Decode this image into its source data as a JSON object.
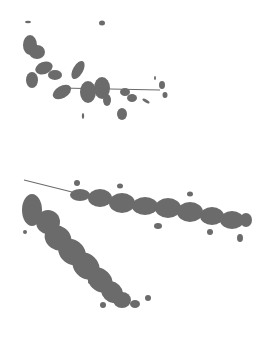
{
  "image": {
    "description": "Grayscale silhouettes of leafy branches on white background",
    "background_color": "#ffffff",
    "foliage_color": "#6b6b6b",
    "regions": [
      {
        "name": "upper-branch",
        "description": "Small leafy twig extending right from left edge"
      },
      {
        "name": "lower-branch-right",
        "description": "Long leafy branch extending to the right"
      },
      {
        "name": "lower-branch-diagonal",
        "description": "Dense leafy branch angling down-right"
      }
    ]
  }
}
